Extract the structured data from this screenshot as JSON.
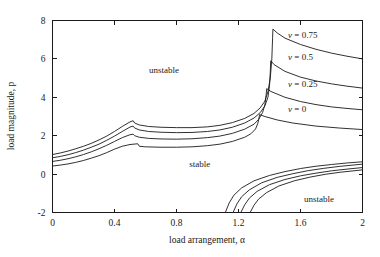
{
  "chart_data": {
    "type": "line",
    "title": "",
    "xlabel": "load arrangement, α",
    "ylabel": "load magnitude, p",
    "xlim": [
      0,
      2
    ],
    "ylim": [
      -2,
      8
    ],
    "xticks": [
      "0",
      "0.4",
      "0.8",
      "1.2",
      "1.6",
      "2"
    ],
    "xtick_values": [
      0,
      0.4,
      0.8,
      1.2,
      1.6,
      2
    ],
    "yticks": [
      "-2",
      "0",
      "2",
      "4",
      "6",
      "8"
    ],
    "ytick_values": [
      -2,
      0,
      2,
      4,
      6,
      8
    ],
    "grid": false,
    "legend_position": "inside-upper-right-inline",
    "annotations": [
      {
        "text": "unstable",
        "x": 0.72,
        "y": 5.25,
        "name": "region-label-unstable-upper"
      },
      {
        "text": "stable",
        "x": 0.95,
        "y": 0.35,
        "name": "region-label-stable"
      },
      {
        "text": "unstable",
        "x": 1.72,
        "y": -1.45,
        "name": "region-label-unstable-lower"
      }
    ],
    "series": [
      {
        "name": "ν = 0.75",
        "label": "ν = 0.75",
        "nu": 0.75,
        "label_x": 1.52,
        "label_y": 7.1,
        "upper_branch": [
          [
            0.0,
            1.02
          ],
          [
            0.05,
            1.1
          ],
          [
            0.1,
            1.2
          ],
          [
            0.15,
            1.32
          ],
          [
            0.2,
            1.45
          ],
          [
            0.25,
            1.6
          ],
          [
            0.3,
            1.78
          ],
          [
            0.35,
            1.98
          ],
          [
            0.4,
            2.22
          ],
          [
            0.45,
            2.48
          ],
          [
            0.5,
            2.72
          ],
          [
            0.52,
            2.78
          ],
          [
            0.53,
            2.66
          ],
          [
            0.56,
            2.56
          ],
          [
            0.62,
            2.48
          ],
          [
            0.7,
            2.44
          ],
          [
            0.8,
            2.42
          ],
          [
            0.9,
            2.42
          ],
          [
            1.0,
            2.46
          ],
          [
            1.08,
            2.54
          ],
          [
            1.16,
            2.68
          ],
          [
            1.24,
            2.9
          ],
          [
            1.3,
            3.16
          ],
          [
            1.34,
            3.45
          ],
          [
            1.37,
            3.8
          ],
          [
            1.39,
            4.3
          ],
          [
            1.405,
            5.0
          ],
          [
            1.415,
            6.0
          ],
          [
            1.42,
            7.1
          ],
          [
            1.422,
            7.55
          ],
          [
            1.45,
            7.35
          ],
          [
            1.5,
            7.08
          ],
          [
            1.6,
            6.75
          ],
          [
            1.7,
            6.5
          ],
          [
            1.8,
            6.3
          ],
          [
            1.9,
            6.14
          ],
          [
            2.0,
            6.0
          ]
        ]
      },
      {
        "name": "ν = 0.5",
        "label": "ν = 0.5",
        "nu": 0.5,
        "label_x": 1.52,
        "label_y": 5.95,
        "upper_branch": [
          [
            0.0,
            0.85
          ],
          [
            0.05,
            0.92
          ],
          [
            0.1,
            1.01
          ],
          [
            0.15,
            1.12
          ],
          [
            0.2,
            1.25
          ],
          [
            0.25,
            1.4
          ],
          [
            0.3,
            1.56
          ],
          [
            0.35,
            1.76
          ],
          [
            0.4,
            1.98
          ],
          [
            0.45,
            2.22
          ],
          [
            0.5,
            2.45
          ],
          [
            0.52,
            2.5
          ],
          [
            0.53,
            2.4
          ],
          [
            0.56,
            2.3
          ],
          [
            0.62,
            2.22
          ],
          [
            0.7,
            2.18
          ],
          [
            0.8,
            2.16
          ],
          [
            0.9,
            2.17
          ],
          [
            1.0,
            2.22
          ],
          [
            1.08,
            2.3
          ],
          [
            1.16,
            2.44
          ],
          [
            1.24,
            2.66
          ],
          [
            1.3,
            2.92
          ],
          [
            1.34,
            3.2
          ],
          [
            1.37,
            3.55
          ],
          [
            1.39,
            4.0
          ],
          [
            1.4,
            4.6
          ],
          [
            1.405,
            5.3
          ],
          [
            1.408,
            5.9
          ],
          [
            1.43,
            5.7
          ],
          [
            1.5,
            5.35
          ],
          [
            1.6,
            5.05
          ],
          [
            1.7,
            4.85
          ],
          [
            1.8,
            4.7
          ],
          [
            1.9,
            4.58
          ],
          [
            2.0,
            4.48
          ]
        ]
      },
      {
        "name": "ν = 0.25",
        "label": "ν = 0.25",
        "nu": 0.25,
        "label_x": 1.52,
        "label_y": 4.55,
        "upper_branch": [
          [
            0.0,
            0.66
          ],
          [
            0.05,
            0.72
          ],
          [
            0.1,
            0.8
          ],
          [
            0.15,
            0.9
          ],
          [
            0.2,
            1.02
          ],
          [
            0.25,
            1.16
          ],
          [
            0.3,
            1.32
          ],
          [
            0.35,
            1.5
          ],
          [
            0.4,
            1.7
          ],
          [
            0.45,
            1.9
          ],
          [
            0.5,
            2.05
          ],
          [
            0.52,
            2.08
          ],
          [
            0.53,
            2.0
          ],
          [
            0.56,
            1.92
          ],
          [
            0.62,
            1.86
          ],
          [
            0.7,
            1.83
          ],
          [
            0.8,
            1.82
          ],
          [
            0.9,
            1.84
          ],
          [
            1.0,
            1.9
          ],
          [
            1.08,
            1.98
          ],
          [
            1.16,
            2.12
          ],
          [
            1.24,
            2.34
          ],
          [
            1.3,
            2.6
          ],
          [
            1.33,
            2.85
          ],
          [
            1.355,
            3.2
          ],
          [
            1.37,
            3.6
          ],
          [
            1.378,
            4.1
          ],
          [
            1.382,
            4.45
          ],
          [
            1.41,
            4.3
          ],
          [
            1.5,
            4.0
          ],
          [
            1.6,
            3.78
          ],
          [
            1.7,
            3.62
          ],
          [
            1.8,
            3.5
          ],
          [
            1.9,
            3.42
          ],
          [
            2.0,
            3.35
          ]
        ]
      },
      {
        "name": "ν = 0",
        "label": "ν = 0",
        "nu": 0,
        "label_x": 1.52,
        "label_y": 3.25,
        "upper_branch": [
          [
            0.0,
            0.42
          ],
          [
            0.05,
            0.47
          ],
          [
            0.1,
            0.53
          ],
          [
            0.15,
            0.61
          ],
          [
            0.2,
            0.71
          ],
          [
            0.25,
            0.83
          ],
          [
            0.3,
            0.96
          ],
          [
            0.35,
            1.12
          ],
          [
            0.4,
            1.3
          ],
          [
            0.45,
            1.45
          ],
          [
            0.5,
            1.54
          ],
          [
            0.55,
            1.58
          ],
          [
            0.56,
            1.45
          ],
          [
            0.6,
            1.42
          ],
          [
            0.7,
            1.4
          ],
          [
            0.8,
            1.4
          ],
          [
            0.9,
            1.42
          ],
          [
            1.0,
            1.48
          ],
          [
            1.08,
            1.56
          ],
          [
            1.16,
            1.7
          ],
          [
            1.24,
            1.92
          ],
          [
            1.28,
            2.1
          ],
          [
            1.31,
            2.35
          ],
          [
            1.325,
            2.65
          ],
          [
            1.333,
            2.95
          ],
          [
            1.336,
            3.1
          ],
          [
            1.37,
            3.0
          ],
          [
            1.45,
            2.82
          ],
          [
            1.55,
            2.66
          ],
          [
            1.7,
            2.5
          ],
          [
            1.85,
            2.4
          ],
          [
            2.0,
            2.32
          ]
        ]
      },
      {
        "name": "lower-branch-ν = 0.75",
        "nu": 0.75,
        "lower_branch": [
          [
            1.115,
            -2.0
          ],
          [
            1.14,
            -1.5
          ],
          [
            1.17,
            -1.1
          ],
          [
            1.22,
            -0.72
          ],
          [
            1.3,
            -0.35
          ],
          [
            1.4,
            -0.07
          ],
          [
            1.5,
            0.13
          ],
          [
            1.6,
            0.29
          ],
          [
            1.7,
            0.41
          ],
          [
            1.8,
            0.5
          ],
          [
            1.9,
            0.58
          ],
          [
            2.0,
            0.64
          ]
        ]
      },
      {
        "name": "lower-branch-ν = 0.5",
        "nu": 0.5,
        "lower_branch": [
          [
            1.165,
            -2.0
          ],
          [
            1.19,
            -1.55
          ],
          [
            1.22,
            -1.18
          ],
          [
            1.27,
            -0.82
          ],
          [
            1.35,
            -0.45
          ],
          [
            1.45,
            -0.17
          ],
          [
            1.55,
            0.02
          ],
          [
            1.65,
            0.18
          ],
          [
            1.75,
            0.3
          ],
          [
            1.85,
            0.4
          ],
          [
            2.0,
            0.52
          ]
        ]
      },
      {
        "name": "lower-branch-ν = 0.25",
        "nu": 0.25,
        "lower_branch": [
          [
            1.215,
            -2.0
          ],
          [
            1.24,
            -1.6
          ],
          [
            1.27,
            -1.25
          ],
          [
            1.32,
            -0.9
          ],
          [
            1.4,
            -0.55
          ],
          [
            1.5,
            -0.28
          ],
          [
            1.6,
            -0.09
          ],
          [
            1.7,
            0.05
          ],
          [
            1.8,
            0.17
          ],
          [
            1.9,
            0.26
          ],
          [
            2.0,
            0.34
          ]
        ]
      },
      {
        "name": "lower-branch-ν = 0",
        "nu": 0,
        "lower_branch": [
          [
            1.275,
            -2.0
          ],
          [
            1.3,
            -1.62
          ],
          [
            1.33,
            -1.3
          ],
          [
            1.38,
            -0.97
          ],
          [
            1.46,
            -0.62
          ],
          [
            1.56,
            -0.35
          ],
          [
            1.66,
            -0.16
          ],
          [
            1.76,
            -0.01
          ],
          [
            1.86,
            0.1
          ],
          [
            2.0,
            0.22
          ]
        ]
      }
    ]
  },
  "figure": {
    "background": "#ffffff",
    "line_color": "#1a1a1a",
    "axis_color": "#1a1a1a"
  }
}
